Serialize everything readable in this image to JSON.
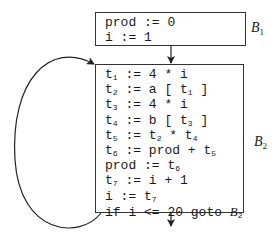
{
  "blocks": [
    {
      "id": "B1",
      "label": {
        "name": "B",
        "sub": "1"
      },
      "lines": [
        [
          {
            "t": "prod := 0"
          }
        ],
        [
          {
            "t": "i := 1"
          }
        ]
      ]
    },
    {
      "id": "B2",
      "label": {
        "name": "B",
        "sub": "2"
      },
      "lines": [
        [
          {
            "t": "t"
          },
          {
            "s": "1"
          },
          {
            "t": " := 4 * i"
          }
        ],
        [
          {
            "t": "t"
          },
          {
            "s": "2"
          },
          {
            "t": " := a [ t"
          },
          {
            "s": "1"
          },
          {
            "t": " ]"
          }
        ],
        [
          {
            "t": "t"
          },
          {
            "s": "3"
          },
          {
            "t": " := 4 * i"
          }
        ],
        [
          {
            "t": "t"
          },
          {
            "s": "4"
          },
          {
            "t": " := b [ t"
          },
          {
            "s": "3"
          },
          {
            "t": " ]"
          }
        ],
        [
          {
            "t": "t"
          },
          {
            "s": "5"
          },
          {
            "t": " := t"
          },
          {
            "s": "2"
          },
          {
            "t": " * t"
          },
          {
            "s": "4"
          }
        ],
        [
          {
            "t": "t"
          },
          {
            "s": "6"
          },
          {
            "t": " := prod + t"
          },
          {
            "s": "5"
          }
        ],
        [
          {
            "t": "prod := t"
          },
          {
            "s": "6"
          }
        ],
        [
          {
            "t": "t"
          },
          {
            "s": "7"
          },
          {
            "t": " := i + 1"
          }
        ],
        [
          {
            "t": "i := t"
          },
          {
            "s": "7"
          }
        ],
        [
          {
            "t": "if i <= 20 goto "
          },
          {
            "g": "B"
          },
          {
            "s": "2"
          }
        ]
      ]
    }
  ],
  "edges": [
    {
      "from": "B1",
      "to": "B2",
      "kind": "fallthrough"
    },
    {
      "from": "B2",
      "to": "B2",
      "kind": "back-edge loop"
    },
    {
      "from": "B2",
      "to": "exit",
      "kind": "fallthrough"
    }
  ]
}
